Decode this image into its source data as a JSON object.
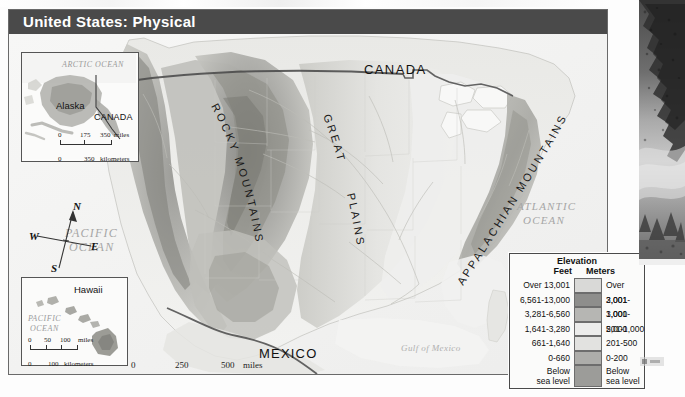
{
  "page": {
    "background": "#ffffff"
  },
  "plate": {
    "title": "United States:  Physical",
    "title_bar_color": "#4a4a4a"
  },
  "map": {
    "country_labels": [
      {
        "name": "canada",
        "text": "CANADA"
      },
      {
        "name": "mexico",
        "text": "MEXICO"
      }
    ],
    "ocean_labels": [
      {
        "name": "pacific-ocean",
        "line1": "PACIFIC",
        "line2": "OCEAN"
      },
      {
        "name": "atlantic-ocean",
        "line1": "ATLANTIC",
        "line2": "OCEAN"
      }
    ],
    "gulf_label": "Gulf of Mexico",
    "physiographic_labels": [
      {
        "name": "rocky-mountains",
        "text": "ROCKY MOUNTAINS"
      },
      {
        "name": "great-plains-1",
        "text": "GREAT"
      },
      {
        "name": "great-plains-2",
        "text": "PLAINS"
      },
      {
        "name": "appalachian-mountains",
        "text": "APPALACHIAN MOUNTAINS"
      }
    ]
  },
  "compass": {
    "north": "N",
    "south": "S",
    "east": "E",
    "west": "W"
  },
  "main_scale": {
    "miles": {
      "t0": "0",
      "t1": "250",
      "t2": "500",
      "unit": "miles"
    },
    "kilometers": {
      "t0": "0",
      "t1": "250",
      "t2": "500",
      "unit": "kilometers"
    }
  },
  "insets": {
    "alaska": {
      "label": "Alaska",
      "neighbor": "CANADA",
      "ocean": "ARCTIC OCEAN",
      "scale": {
        "miles": {
          "t0": "0",
          "t1": "175",
          "t2": "350",
          "unit": "miles"
        },
        "kilometers": {
          "t0": "0",
          "t2": "350",
          "unit": "kilometers"
        }
      }
    },
    "hawaii": {
      "label": "Hawaii",
      "ocean_line1": "PACIFIC",
      "ocean_line2": "OCEAN",
      "scale": {
        "miles": {
          "t0": "0",
          "t1": "50",
          "t2": "100",
          "unit": "miles"
        },
        "kilometers": {
          "t0": "0",
          "t2": "100",
          "unit": "kilometers"
        }
      }
    }
  },
  "legend": {
    "title": "Elevation",
    "col_feet": "Feet",
    "col_meters": "Meters",
    "rows": [
      {
        "feet": "Over 13,001",
        "meters": "Over 3,001",
        "color": "#d9d9d7"
      },
      {
        "feet": "6,561-13,000",
        "meters": "2,001-3,000",
        "color": "#8e8e8c"
      },
      {
        "feet": "3,281-6,560",
        "meters": "1,001-2,000",
        "color": "#b6b6b3"
      },
      {
        "feet": "1,641-3,280",
        "meters": "501-1,000",
        "color": "#ececeb"
      },
      {
        "feet": "661-1,640",
        "meters": "201-500",
        "color": "#e2e2e0"
      },
      {
        "feet": "0-660",
        "meters": "0-200",
        "color": "#adadaa"
      },
      {
        "feet": "Below\nsea level",
        "meters": "Below\nsea level",
        "color": "#9c9c99",
        "feet_l1": "Below",
        "feet_l2": "sea level",
        "meters_l1": "Below",
        "meters_l2": "sea level"
      }
    ]
  }
}
